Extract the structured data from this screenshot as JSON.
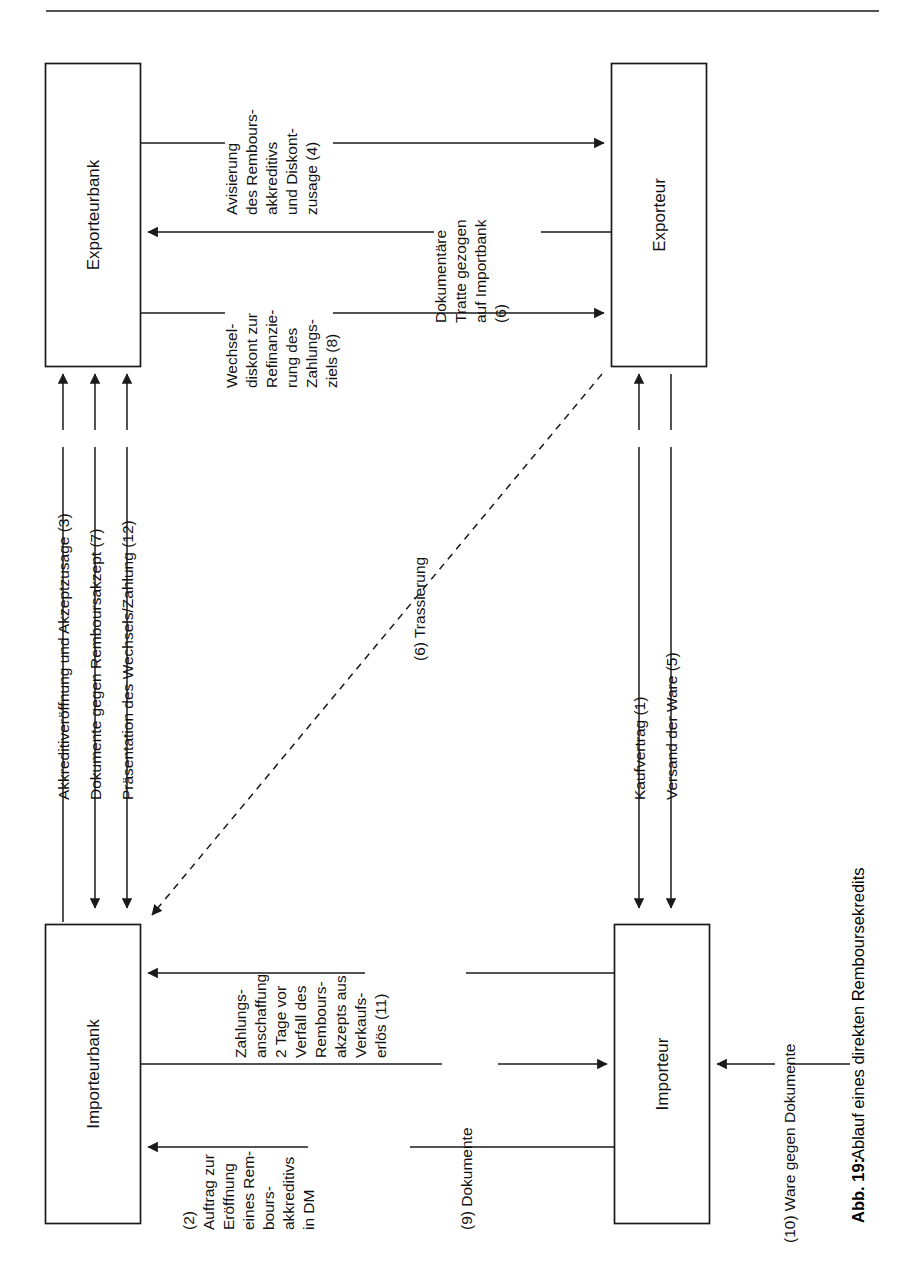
{
  "figure": {
    "caption_bold": "Abb. 19:",
    "caption_text": " Ablauf eines direkten Remboursekredits"
  },
  "nodes": {
    "exporteurbank": "Exporteurbank",
    "exporteur": "Exporteur",
    "importeurbank": "Importeurbank",
    "importeur": "Importeur"
  },
  "flows": {
    "f3": "Akkreditiveröffnung und Akzeptzusage (3)",
    "f7": "Dokumente gegen Remboursakzept (7)",
    "f12": "Präsentation des Wechsels/Zahlung (12)",
    "f4": [
      "Avisierung",
      "des Rembours-",
      "akkreditivs",
      "und Diskont-",
      "zusage (4)"
    ],
    "f6": [
      "Dokumentäre",
      "Tratte gezogen",
      "auf Importbank",
      "(6)"
    ],
    "f8": [
      "Wechsel-",
      "diskont zur",
      "Refinanzie-",
      "rung des",
      "Zahlungs-",
      "ziels (8)"
    ],
    "f6t": "(6) Trassierung",
    "f1": "Kaufvertrag (1)",
    "f5": "Versand der Ware (5)",
    "f11": [
      "Zahlungs-",
      "anschaffung",
      "2 Tage vor",
      "Verfall des",
      "Rembours-",
      "akzepts aus",
      "Verkaufs-",
      "erlös (11)"
    ],
    "f2": [
      "(2)",
      "Auftrag zur",
      "Eröffnung",
      "eines Rem-",
      "bours-",
      "akkreditivs",
      "in DM"
    ],
    "f9": "(9) Dokumente",
    "f10": "(10) Ware gegen Dokumente"
  },
  "colors": {
    "stroke": "#1a1a1a",
    "background": "#ffffff"
  }
}
